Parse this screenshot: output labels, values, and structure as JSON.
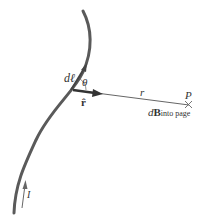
{
  "labels": {
    "dl": "dℓ",
    "theta": "θ",
    "rhat": "r̂",
    "r": "r",
    "P": "P",
    "dB_d": "d",
    "dB_B": "B",
    "dB_sub": "into page",
    "I": "I"
  },
  "colors": {
    "wire": "#555555",
    "text": "#333333",
    "line": "#666666"
  }
}
